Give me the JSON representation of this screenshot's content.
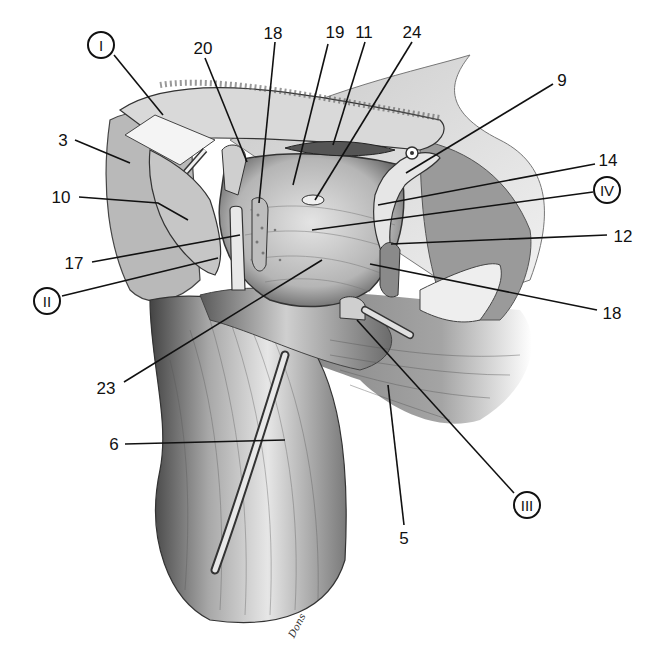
{
  "figure": {
    "type": "anatomical illustration",
    "style": "grayscale pencil/ink rendering",
    "signature": "Dons"
  },
  "labels": [
    {
      "id": "I",
      "text": "I",
      "circled": true,
      "x": 101,
      "y": 45,
      "line": [
        [
          114,
          55
        ],
        [
          163,
          115
        ]
      ]
    },
    {
      "id": "20",
      "text": "20",
      "circled": false,
      "x": 203,
      "y": 48,
      "line": [
        [
          205,
          58
        ],
        [
          247,
          162
        ]
      ]
    },
    {
      "id": "18a",
      "text": "18",
      "circled": false,
      "x": 273,
      "y": 33,
      "line": [
        [
          275,
          42
        ],
        [
          259,
          203
        ]
      ]
    },
    {
      "id": "19",
      "text": "19",
      "circled": false,
      "x": 335,
      "y": 32,
      "line": [
        [
          328,
          44
        ],
        [
          293,
          185
        ]
      ]
    },
    {
      "id": "11",
      "text": "11",
      "circled": false,
      "x": 364,
      "y": 32,
      "line": [
        [
          365,
          42
        ],
        [
          333,
          145
        ]
      ]
    },
    {
      "id": "24",
      "text": "24",
      "circled": false,
      "x": 412,
      "y": 32,
      "line": [
        [
          412,
          42
        ],
        [
          315,
          200
        ]
      ]
    },
    {
      "id": "9",
      "text": "9",
      "circled": false,
      "x": 562,
      "y": 80,
      "line": [
        [
          553,
          84
        ],
        [
          406,
          173
        ]
      ]
    },
    {
      "id": "14",
      "text": "14",
      "circled": false,
      "x": 608,
      "y": 160,
      "line": [
        [
          595,
          164
        ],
        [
          378,
          205
        ]
      ]
    },
    {
      "id": "IV",
      "text": "IV",
      "circled": true,
      "x": 607,
      "y": 190,
      "line": [
        [
          593,
          192
        ],
        [
          312,
          230
        ]
      ]
    },
    {
      "id": "12",
      "text": "12",
      "circled": false,
      "x": 623,
      "y": 236,
      "line": [
        [
          607,
          235
        ],
        [
          391,
          244
        ]
      ]
    },
    {
      "id": "18b",
      "text": "18",
      "circled": false,
      "x": 612,
      "y": 313,
      "line": [
        [
          597,
          310
        ],
        [
          370,
          264
        ]
      ]
    },
    {
      "id": "3",
      "text": "3",
      "circled": false,
      "x": 63,
      "y": 140,
      "line": [
        [
          75,
          140
        ],
        [
          130,
          163
        ]
      ]
    },
    {
      "id": "10",
      "text": "10",
      "circled": false,
      "x": 61,
      "y": 197,
      "line": [
        [
          79,
          197
        ],
        [
          158,
          203
        ],
        [
          188,
          220
        ]
      ]
    },
    {
      "id": "17",
      "text": "17",
      "circled": false,
      "x": 74,
      "y": 263,
      "line": [
        [
          92,
          262
        ],
        [
          240,
          235
        ]
      ]
    },
    {
      "id": "II",
      "text": "II",
      "circled": true,
      "x": 47,
      "y": 301,
      "line": [
        [
          62,
          296
        ],
        [
          218,
          258
        ]
      ]
    },
    {
      "id": "23",
      "text": "23",
      "circled": false,
      "x": 106,
      "y": 388,
      "line": [
        [
          124,
          382
        ],
        [
          322,
          260
        ]
      ]
    },
    {
      "id": "6",
      "text": "6",
      "circled": false,
      "x": 114,
      "y": 444,
      "line": [
        [
          125,
          444
        ],
        [
          285,
          440
        ]
      ]
    },
    {
      "id": "5",
      "text": "5",
      "circled": false,
      "x": 404,
      "y": 538,
      "line": [
        [
          404,
          525
        ],
        [
          388,
          385
        ]
      ]
    },
    {
      "id": "III",
      "text": "III",
      "circled": true,
      "x": 527,
      "y": 505,
      "line": [
        [
          514,
          493
        ],
        [
          357,
          320
        ]
      ]
    }
  ],
  "colors": {
    "ink": "#111111",
    "background": "#ffffff"
  }
}
